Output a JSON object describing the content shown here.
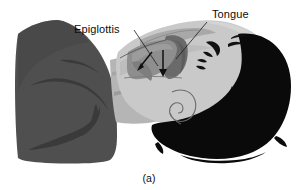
{
  "figure": {
    "caption": "(a)",
    "kind": "anatomical-illustration",
    "background_color": "#ffffff"
  },
  "labels": [
    {
      "id": "epiglottis",
      "text": "Epiglottis",
      "x": 74,
      "y": 33,
      "leader_from": [
        134,
        30
      ],
      "leader_to": [
        158,
        66
      ]
    },
    {
      "id": "tongue",
      "text": "Tongue",
      "x": 212,
      "y": 18,
      "leader_from": [
        207,
        22
      ],
      "leader_to": [
        176,
        59
      ]
    }
  ],
  "arrows": [
    {
      "id": "epiglottis-arrow",
      "name": "epiglottis-direction-arrow",
      "from": [
        152,
        52
      ],
      "to": [
        138,
        70
      ]
    },
    {
      "id": "airway-arrow",
      "name": "airway-direction-arrow",
      "from": [
        163,
        50
      ],
      "to": [
        163,
        76
      ]
    }
  ],
  "regions": [
    {
      "id": "pillow",
      "name": "pillow",
      "color": "#4f4f4f",
      "note": "wedge-shaped pillow supporting the head, left side"
    },
    {
      "id": "pillow-contour",
      "name": "pillow-contour-line",
      "color": "#3a3a3a",
      "note": "darker curved fold lines on the pillow"
    },
    {
      "id": "neck",
      "name": "neck",
      "color": "#b5b5b5",
      "note": "neck and jaw underside tissue"
    },
    {
      "id": "face",
      "name": "face-profile",
      "color": "#c9c9c9",
      "note": "light gray facial profile, chin to forehead"
    },
    {
      "id": "airway",
      "name": "airway-cavity",
      "color": "#6a6a6a",
      "note": "dark gray open pharyngeal airway behind the tongue"
    },
    {
      "id": "tongue-body",
      "name": "tongue-body",
      "color": "#8e8e8e",
      "note": "mid gray tongue mass"
    },
    {
      "id": "palate",
      "name": "soft-palate",
      "color": "#a8a8a8",
      "note": "soft palate / roof of mouth band"
    },
    {
      "id": "hair",
      "name": "hair",
      "color": "#0a0a0a",
      "note": "black hair mass behind and under the head"
    },
    {
      "id": "features",
      "name": "facial-features",
      "color": "#111111",
      "note": "nose, closed eye, lips and ear drawn as dark strokes"
    }
  ],
  "colors": {
    "background": "#ffffff",
    "pillow": "#4f4f4f",
    "pillow_dark": "#3a3a3a",
    "face": "#c9c9c9",
    "face_shadow": "#b5b5b5",
    "airway": "#6a6a6a",
    "tongue": "#8e8e8e",
    "palate": "#a8a8a8",
    "hair": "#0a0a0a",
    "ink": "#111111"
  }
}
